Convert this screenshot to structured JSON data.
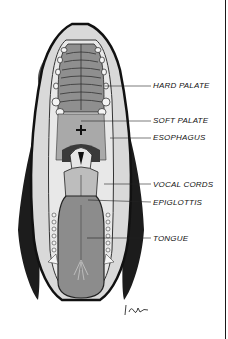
{
  "figure": {
    "labels": [
      {
        "id": "hard-palate",
        "text": "HARD PALATE",
        "x": 153,
        "y": 81
      },
      {
        "id": "soft-palate",
        "text": "SOFT PALATE",
        "x": 153,
        "y": 118
      },
      {
        "id": "esophagus",
        "text": "ESOPHAGUS",
        "x": 153,
        "y": 135
      },
      {
        "id": "vocal-cords",
        "text": "VOCAL CORDS",
        "x": 153,
        "y": 180
      },
      {
        "id": "epiglottis",
        "text": "EPIGLOTTIS",
        "x": 153,
        "y": 199
      },
      {
        "id": "tongue",
        "text": "TONGUE",
        "x": 153,
        "y": 235
      }
    ],
    "signature": "IOM",
    "colors": {
      "ink": "#111111",
      "tissue": "#8a8a8a",
      "tissue_light": "#c9c9c9",
      "fur": "#1c1c1c"
    }
  }
}
